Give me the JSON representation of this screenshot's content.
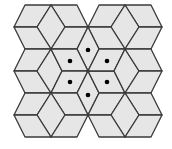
{
  "figure": {
    "title": "",
    "colors": {
      "background": "#ffffff",
      "fill": "#e6e6e6",
      "stroke": "#3a3a3a",
      "dot": "#000000"
    },
    "stroke_width": 1.3,
    "dot_radius": 2.3,
    "rhombi": [
      "25,5 51,5 37,27 14,27",
      "51,5 77,5 88,27 65,27",
      "51,5 65,27 51,49 37,27",
      "14,27 37,27 51,49 25,49",
      "65,27 88,27 77,49 51,49",
      "99,5 125,5 111,27 88,27",
      "125,5 151,5 162,27 139,27",
      "125,5 139,27 125,49 111,27",
      "88,27 111,27 125,49 99,49",
      "139,27 162,27 151,49 125,49",
      "25,49 51,49 37,71 14,71",
      "14,71 37,71 51,93 25,93",
      "51,49 62,71 51,93 37,71",
      "88,71 77,49 88,27 99,49",
      "88,71 77,49 51,49 62,71",
      "88,71 62,71 51,93 77,93",
      "88,71 77,93 88,115 99,93",
      "88,71 99,93 125,93 114,71",
      "88,71 114,71 125,49 99,49",
      "125,49 139,71 125,93 114,71",
      "125,49 151,49 162,71 139,71",
      "139,71 162,71 151,93 125,93",
      "25,93 51,93 37,115 14,115",
      "51,93 77,93 88,115 65,115",
      "51,93 65,115 51,137 37,115",
      "14,115 37,115 51,137 25,137",
      "65,115 88,115 77,137 51,137",
      "99,93 125,93 111,115 88,115",
      "125,93 151,93 162,115 139,115",
      "125,93 139,115 125,137 111,115",
      "88,115 111,115 125,137 99,137",
      "139,115 162,115 151,137 125,137"
    ],
    "dots": [
      [
        88,
        50
      ],
      [
        70,
        61
      ],
      [
        107,
        61
      ],
      [
        70,
        82
      ],
      [
        107,
        82
      ],
      [
        88,
        95
      ]
    ]
  }
}
